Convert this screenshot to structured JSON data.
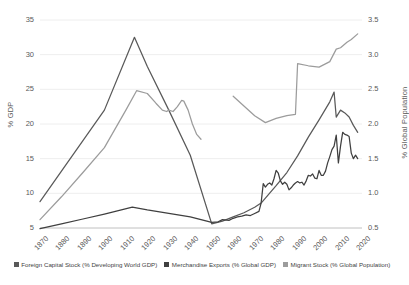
{
  "chart_data": {
    "type": "line",
    "title": "",
    "xlabel": "",
    "ylabel": "% GDP",
    "y2label": "% Global Population",
    "grid": true,
    "legend_position": "bottom",
    "x_ticks": [
      "1870",
      "1880",
      "1890",
      "1900",
      "1910",
      "1920",
      "1930",
      "1940",
      "1950",
      "1960",
      "1970",
      "1980",
      "1990",
      "2000",
      "2010",
      "2020"
    ],
    "xlim": [
      1870,
      2020
    ],
    "ylim": [
      5,
      35
    ],
    "y_ticks": [
      "5",
      "10",
      "15",
      "20",
      "25",
      "30",
      "35"
    ],
    "y2lim": [
      0.5,
      3.5
    ],
    "y2_ticks": [
      "0.5",
      "1.0",
      "1.5",
      "2.0",
      "2.5",
      "3.0",
      "3.5"
    ],
    "series": [
      {
        "name": "Foreign Capital Stock (% Developing World GDP)",
        "axis": "left",
        "color": "#595959",
        "points": [
          [
            1870,
            8.8
          ],
          [
            1880,
            13.2
          ],
          [
            1890,
            17.6
          ],
          [
            1900,
            22.0
          ],
          [
            1914,
            32.5
          ],
          [
            1920,
            28.3
          ],
          [
            1930,
            22.0
          ],
          [
            1940,
            15.5
          ],
          [
            1950,
            5.6
          ],
          [
            1955,
            6.0
          ],
          [
            1960,
            6.6
          ],
          [
            1965,
            7.2
          ],
          [
            1970,
            8.0
          ],
          [
            1973,
            8.6
          ],
          [
            1975,
            9.3
          ],
          [
            1980,
            11.1
          ],
          [
            1985,
            13.0
          ],
          [
            1990,
            15.4
          ],
          [
            1995,
            18.1
          ],
          [
            2000,
            20.6
          ],
          [
            2005,
            23.2
          ],
          [
            2007,
            24.6
          ],
          [
            2008,
            21.0
          ],
          [
            2010,
            22.0
          ],
          [
            2012,
            21.6
          ],
          [
            2014,
            21.0
          ],
          [
            2016,
            19.8
          ],
          [
            2018,
            18.8
          ]
        ]
      },
      {
        "name": "Merchandise Exports (% Global GDP)",
        "axis": "left",
        "color": "#404040",
        "points": [
          [
            1870,
            4.9
          ],
          [
            1880,
            5.6
          ],
          [
            1890,
            6.3
          ],
          [
            1900,
            7.0
          ],
          [
            1913,
            8.0
          ],
          [
            1920,
            7.6
          ],
          [
            1930,
            7.1
          ],
          [
            1940,
            6.6
          ],
          [
            1950,
            5.8
          ],
          [
            1953,
            5.9
          ],
          [
            1955,
            6.2
          ],
          [
            1958,
            6.1
          ],
          [
            1960,
            6.4
          ],
          [
            1962,
            6.6
          ],
          [
            1964,
            6.7
          ],
          [
            1966,
            6.9
          ],
          [
            1968,
            6.8
          ],
          [
            1970,
            7.1
          ],
          [
            1972,
            7.4
          ],
          [
            1973,
            8.6
          ],
          [
            1974,
            11.4
          ],
          [
            1975,
            10.9
          ],
          [
            1976,
            11.3
          ],
          [
            1977,
            11.5
          ],
          [
            1978,
            11.2
          ],
          [
            1979,
            12.1
          ],
          [
            1980,
            13.3
          ],
          [
            1981,
            12.9
          ],
          [
            1982,
            11.8
          ],
          [
            1983,
            11.3
          ],
          [
            1984,
            11.6
          ],
          [
            1985,
            11.3
          ],
          [
            1986,
            10.5
          ],
          [
            1987,
            10.8
          ],
          [
            1988,
            11.2
          ],
          [
            1989,
            11.5
          ],
          [
            1990,
            11.7
          ],
          [
            1991,
            11.5
          ],
          [
            1992,
            11.6
          ],
          [
            1993,
            11.2
          ],
          [
            1994,
            11.8
          ],
          [
            1995,
            12.6
          ],
          [
            1996,
            12.5
          ],
          [
            1997,
            12.8
          ],
          [
            1998,
            12.2
          ],
          [
            1999,
            12.1
          ],
          [
            2000,
            13.3
          ],
          [
            2001,
            12.6
          ],
          [
            2002,
            12.6
          ],
          [
            2003,
            13.2
          ],
          [
            2004,
            14.4
          ],
          [
            2005,
            15.3
          ],
          [
            2006,
            16.3
          ],
          [
            2007,
            16.8
          ],
          [
            2008,
            18.4
          ],
          [
            2009,
            14.4
          ],
          [
            2010,
            16.8
          ],
          [
            2011,
            18.8
          ],
          [
            2012,
            18.5
          ],
          [
            2013,
            18.4
          ],
          [
            2014,
            18.2
          ],
          [
            2015,
            15.8
          ],
          [
            2016,
            15.0
          ],
          [
            2017,
            15.5
          ],
          [
            2018,
            15.0
          ]
        ]
      },
      {
        "name": "Migrant Stock (% Global Population)",
        "axis": "right",
        "color": "#9c9c9c",
        "points": [
          [
            1870,
            0.62
          ],
          [
            1880,
            0.95
          ],
          [
            1890,
            1.3
          ],
          [
            1900,
            1.66
          ],
          [
            1910,
            2.2
          ],
          [
            1915,
            2.48
          ],
          [
            1920,
            2.44
          ],
          [
            1924,
            2.3
          ],
          [
            1927,
            2.2
          ],
          [
            1929,
            2.18
          ],
          [
            1930,
            2.2
          ],
          [
            1932,
            2.18
          ],
          [
            1934,
            2.25
          ],
          [
            1936,
            2.34
          ],
          [
            1937,
            2.33
          ],
          [
            1939,
            2.2
          ],
          [
            1941,
            2.0
          ],
          [
            1943,
            1.85
          ],
          [
            1945,
            1.78
          ]
        ]
      },
      {
        "name": "Migrant Stock (% Global Population)",
        "axis": "right",
        "color": "#9c9c9c",
        "points": [
          [
            1960,
            2.4
          ],
          [
            1965,
            2.26
          ],
          [
            1970,
            2.12
          ],
          [
            1975,
            2.02
          ],
          [
            1980,
            2.08
          ],
          [
            1985,
            2.12
          ],
          [
            1989,
            2.14
          ],
          [
            1990,
            2.87
          ],
          [
            1995,
            2.84
          ],
          [
            2000,
            2.82
          ],
          [
            2005,
            2.9
          ],
          [
            2008,
            3.08
          ],
          [
            2010,
            3.1
          ],
          [
            2013,
            3.18
          ],
          [
            2015,
            3.22
          ],
          [
            2018,
            3.3
          ]
        ]
      }
    ]
  },
  "axes": {
    "left_title": "% GDP",
    "right_title": "% Global Population"
  },
  "legend": {
    "items": [
      {
        "label": "Foreign Capital Stock (% Developing World GDP)",
        "color": "#595959"
      },
      {
        "label": "Merchandise Exports (% Global GDP)",
        "color": "#404040"
      },
      {
        "label": "Migrant Stock (% Global Population)",
        "color": "#9c9c9c"
      }
    ]
  }
}
